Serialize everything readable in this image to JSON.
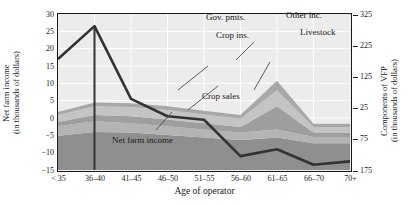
{
  "axes": {
    "left_title": "Net farm income\n(in thousands of dollars)",
    "left_title_line1": "Net farm income",
    "left_title_line2": "(in thousands of dollars)",
    "right_title_line1": "Components of VFP",
    "right_title_line2": "(in thousands of dollars)",
    "x_title": "Age of operator",
    "left_ticks": [
      "30",
      "25",
      "20",
      "15",
      "10",
      "5",
      "0",
      "−5",
      "−10",
      "−15"
    ],
    "right_ticks": [
      "325",
      "225",
      "125",
      "25",
      "75",
      "175"
    ],
    "x_ticks": [
      "< 35",
      "36–40",
      "41–45",
      "46–50",
      "51–55",
      "56–60",
      "61–65",
      "66–70",
      "70+"
    ]
  },
  "annotations": {
    "gov_pmts": "Gov. pmts.",
    "crop_ins": "Crop ins.",
    "other_inc": "Other inc.",
    "livestock": "Livestock",
    "crop_sales": "Crop sales",
    "net_farm_income": "Net farm income"
  },
  "colors": {
    "plot_background": "#ececec",
    "axis": "#1a1a1a",
    "gridline": "#ffffff",
    "line_net_farm_income": "#333333",
    "band_crop_sales": "#8f8f8f",
    "band_livestock": "#b4b4b4",
    "band_crop_ins": "#9e9e9e",
    "band_gov_pmts": "#c4c4c4",
    "band_other_inc": "#a8a8a8"
  },
  "chart_data": {
    "type": "area",
    "title": "",
    "xlabel": "Age of operator",
    "ylabel": "Net farm income (in thousands of dollars)",
    "y2label": "Components of VFP (in thousands of dollars)",
    "categories": [
      "< 35",
      "36–40",
      "41–45",
      "46–50",
      "51–55",
      "56–60",
      "61–65",
      "66–70",
      "70+"
    ],
    "ylim": [
      -15,
      30
    ],
    "y2lim": [
      -175,
      325
    ],
    "y_ticks": [
      30,
      25,
      20,
      15,
      10,
      5,
      0,
      -5,
      -10,
      -15
    ],
    "y2_ticks": [
      325,
      225,
      125,
      25,
      -75,
      -175
    ],
    "grid": true,
    "legend_position": "inline-annotations",
    "series": [
      {
        "name": "Crop sales",
        "axis": "right",
        "stacked": true,
        "color": "#8f8f8f",
        "values": [
          110,
          122,
          120,
          112,
          104,
          96,
          104,
          86,
          86
        ]
      },
      {
        "name": "Livestock",
        "axis": "right",
        "stacked": true,
        "color": "#b4b4b4",
        "values": [
          30,
          34,
          30,
          28,
          26,
          24,
          26,
          20,
          20
        ]
      },
      {
        "name": "Crop ins.",
        "axis": "right",
        "stacked": true,
        "color": "#9e9e9e",
        "values": [
          14,
          20,
          22,
          22,
          20,
          18,
          74,
          14,
          14
        ]
      },
      {
        "name": "Gov. pmts.",
        "axis": "right",
        "stacked": true,
        "color": "#c4c4c4",
        "values": [
          22,
          28,
          30,
          30,
          28,
          26,
          52,
          18,
          18
        ]
      },
      {
        "name": "Other inc.",
        "axis": "right",
        "stacked": true,
        "color": "#a8a8a8",
        "values": [
          10,
          12,
          12,
          12,
          12,
          12,
          30,
          10,
          10
        ]
      },
      {
        "name": "Net farm income",
        "axis": "left",
        "stacked": false,
        "type": "line",
        "color": "#333333",
        "values": [
          17.0,
          26.5,
          5.5,
          0.5,
          -0.5,
          -11.0,
          -9.0,
          -13.5,
          -12.5
        ]
      }
    ]
  }
}
